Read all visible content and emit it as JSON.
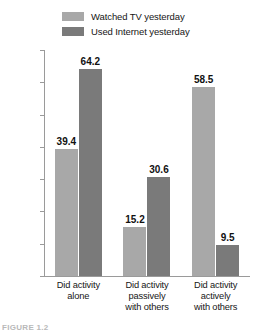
{
  "chart_data": {
    "type": "bar",
    "title": "",
    "subtitle": "",
    "xlabel": "",
    "ylabel": "",
    "ylim": [
      0,
      70
    ],
    "ytick_step": 10,
    "ytick_labels": [
      "70%",
      "60%",
      "50%",
      "40%",
      "30%",
      "20%",
      "10%",
      "0%"
    ],
    "ytick_values": [
      70,
      60,
      50,
      40,
      30,
      20,
      10,
      0
    ],
    "grid": false,
    "legend_position": "top-center",
    "categories": [
      "Did activity alone",
      "Did activity passively with others",
      "Did activity actively with others"
    ],
    "category_lines": [
      [
        "Did activity",
        "alone"
      ],
      [
        "Did activity",
        "passively",
        "with others"
      ],
      [
        "Did activity",
        "actively",
        "with others"
      ]
    ],
    "series": [
      {
        "name": "Watched TV yesterday",
        "color": "#a8a8a8",
        "values": [
          39.4,
          15.2,
          58.5
        ],
        "labels": [
          "39.4",
          "15.2",
          "58.5"
        ]
      },
      {
        "name": "Used Internet yesterday",
        "color": "#7a7a7a",
        "values": [
          64.2,
          30.6,
          9.5
        ],
        "labels": [
          "64.2",
          "30.6",
          "9.5"
        ]
      }
    ]
  },
  "legend": {
    "items": [
      {
        "label": "Watched TV yesterday",
        "color": "#a8a8a8"
      },
      {
        "label": "Used Internet yesterday",
        "color": "#7a7a7a"
      }
    ]
  },
  "caption": {
    "text": "FIGURE 1.2"
  },
  "colors": {
    "series_light": "#a8a8a8",
    "series_dark": "#7a7a7a",
    "axis": "#9a9a9a",
    "text": "#161616"
  }
}
